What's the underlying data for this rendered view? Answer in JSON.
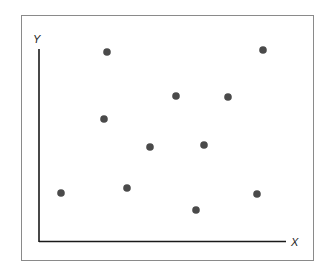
{
  "chart_data": {
    "type": "scatter",
    "title": "",
    "xlabel": "X",
    "ylabel": "Y",
    "grid": false,
    "legend": null,
    "axis_ticks": "none",
    "points_pixel": [
      {
        "x": 107,
        "y": 52
      },
      {
        "x": 263,
        "y": 50
      },
      {
        "x": 176,
        "y": 96
      },
      {
        "x": 228,
        "y": 97
      },
      {
        "x": 104,
        "y": 119
      },
      {
        "x": 150,
        "y": 147
      },
      {
        "x": 204,
        "y": 145
      },
      {
        "x": 61,
        "y": 193
      },
      {
        "x": 127,
        "y": 188
      },
      {
        "x": 196,
        "y": 210
      },
      {
        "x": 257,
        "y": 194
      }
    ],
    "points": [
      {
        "x": 0.28,
        "y": 0.99
      },
      {
        "x": 0.91,
        "y": 1.0
      },
      {
        "x": 0.56,
        "y": 0.76
      },
      {
        "x": 0.77,
        "y": 0.75
      },
      {
        "x": 0.26,
        "y": 0.64
      },
      {
        "x": 0.45,
        "y": 0.49
      },
      {
        "x": 0.67,
        "y": 0.5
      },
      {
        "x": 0.09,
        "y": 0.25
      },
      {
        "x": 0.36,
        "y": 0.28
      },
      {
        "x": 0.64,
        "y": 0.16
      },
      {
        "x": 0.88,
        "y": 0.24
      }
    ],
    "xlim": [
      0,
      1.0
    ],
    "ylim": [
      0,
      1.0
    ]
  },
  "colors": {
    "point": "#4a4a4a",
    "axis": "#1a1a1a",
    "frame": "#8a8a8a"
  }
}
